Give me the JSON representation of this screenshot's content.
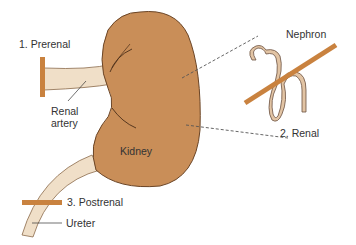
{
  "diagram": {
    "labels": {
      "prerenal": "1. Prerenal",
      "renal_artery_line1": "Renal",
      "renal_artery_line2": "artery",
      "kidney": "Kidney",
      "nephron": "Nephron",
      "renal": "2. Renal",
      "postrenal": "3. Postrenal",
      "ureter": "Ureter"
    },
    "colors": {
      "kidney_fill": "#C98E58",
      "kidney_outline": "#6B4526",
      "vessel_fill": "#F0DFC8",
      "vessel_outline": "#8A6A4A",
      "blockage_bar": "#C9823F",
      "nephron_fill": "#E2C4A4",
      "text": "#333333"
    }
  }
}
